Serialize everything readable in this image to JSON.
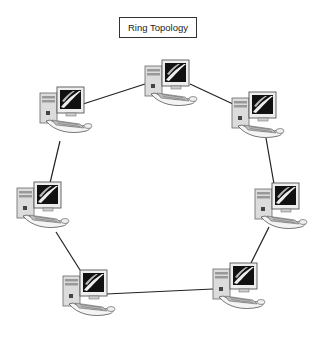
{
  "diagram": {
    "title": "Ring Topology",
    "type": "network-topology",
    "topology": "ring",
    "nodes": [
      {
        "id": "pc-top",
        "label": "",
        "x": 145,
        "y": 60
      },
      {
        "id": "pc-top-right",
        "label": "",
        "x": 232,
        "y": 92
      },
      {
        "id": "pc-mid-right",
        "label": "",
        "x": 255,
        "y": 183
      },
      {
        "id": "pc-bottom-right",
        "label": "",
        "x": 213,
        "y": 263
      },
      {
        "id": "pc-bottom-left",
        "label": "",
        "x": 63,
        "y": 270
      },
      {
        "id": "pc-mid-left",
        "label": "",
        "x": 17,
        "y": 182
      },
      {
        "id": "pc-top-left",
        "label": "",
        "x": 40,
        "y": 87
      }
    ],
    "edges": [
      [
        "pc-top",
        "pc-top-right"
      ],
      [
        "pc-top-right",
        "pc-mid-right"
      ],
      [
        "pc-mid-right",
        "pc-bottom-right"
      ],
      [
        "pc-bottom-right",
        "pc-bottom-left"
      ],
      [
        "pc-bottom-left",
        "pc-mid-left"
      ],
      [
        "pc-mid-left",
        "pc-top-left"
      ],
      [
        "pc-top-left",
        "pc-top"
      ]
    ],
    "colors": {
      "line": "#222222",
      "monitor_screen": "#111111",
      "case": "#d8d8d8",
      "outline": "#555555"
    }
  }
}
